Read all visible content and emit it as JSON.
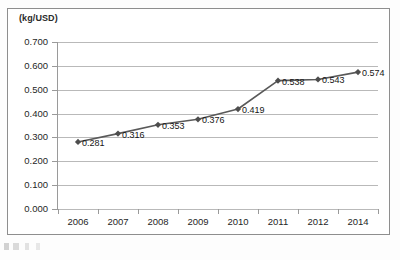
{
  "figure": {
    "axis_title": "(kg/USD)"
  },
  "chart_data": {
    "type": "line",
    "title": "",
    "subtitle": "",
    "xlabel": "",
    "ylabel": "(kg/USD)",
    "categories": [
      "2006",
      "2007",
      "2008",
      "2009",
      "2010",
      "2011",
      "2012",
      "2014"
    ],
    "values": [
      0.281,
      0.316,
      0.353,
      0.376,
      0.419,
      0.538,
      0.543,
      0.574
    ],
    "point_labels": [
      "0.281",
      "0.316",
      "0.353",
      "0.376",
      "0.419",
      "0.538",
      "0.543",
      "0.574"
    ],
    "ylim": [
      0.0,
      0.7
    ],
    "ytick_step": 0.1,
    "ytick_labels": [
      "0.700",
      "0.600",
      "0.500",
      "0.400",
      "0.300",
      "0.200",
      "0.100",
      "0.000"
    ],
    "ytick_values": [
      0.7,
      0.6,
      0.5,
      0.4,
      0.3,
      0.2,
      0.1,
      0.0
    ],
    "grid": true,
    "legend": false,
    "legend_position": "none",
    "marker": "diamond",
    "series": [
      {
        "name": "",
        "values": [
          0.281,
          0.316,
          0.353,
          0.376,
          0.419,
          0.538,
          0.543,
          0.574
        ]
      }
    ],
    "colors": {
      "line": "#595959",
      "marker": "#4d4d4d",
      "gridline": "#b9b9b9",
      "axis": "#9a9a9a",
      "text": "#1f1f1f",
      "border": "#8e8e8e",
      "background": "#ffffff"
    }
  }
}
